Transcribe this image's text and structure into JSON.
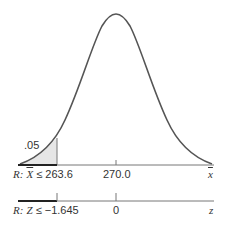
{
  "diagram": {
    "type": "normal-distribution-rejection-region",
    "curve": {
      "mean_label": "270.0",
      "color": "#555555"
    },
    "shaded_region": {
      "area_label": ".05",
      "fill": "#e6e6e6",
      "boundary": "263.6"
    },
    "axis_xbar": {
      "region_label_prefix": "R:",
      "region_label_var": "X",
      "region_label_rel": "≤ 263.6",
      "center_tick_label": "270.0",
      "axis_symbol": "x"
    },
    "axis_z": {
      "region_label_prefix": "R:",
      "region_label_var": "Z",
      "region_label_rel": "≤ −1.645",
      "center_tick_label": "0",
      "axis_symbol": "z"
    }
  }
}
